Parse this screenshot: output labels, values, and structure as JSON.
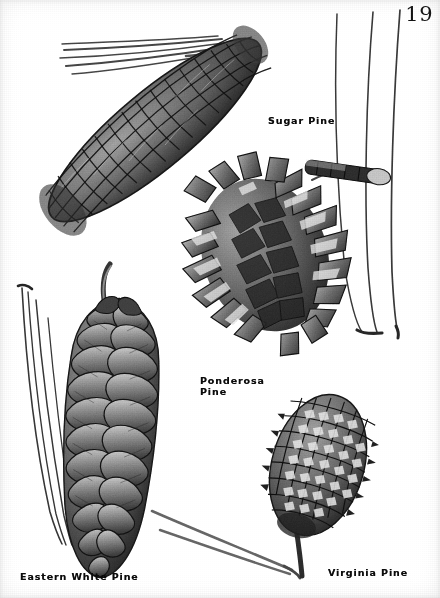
{
  "plate": {
    "page_number": "19",
    "background_color": "#fdfdfb",
    "ink_color": "#1a1a1a",
    "medium": "halftone photographic plate",
    "subject": "pine cones"
  },
  "specimens": [
    {
      "id": "sugar-pine",
      "label": "Sugar Pine",
      "label_lines": "Sugar Pine",
      "label_x": 268,
      "label_y": 115,
      "description": "very long tapering cone angled from lower-left to upper-right with broad diamond scales",
      "has_needles": true
    },
    {
      "id": "ponderosa-pine",
      "label": "Ponderosa Pine",
      "label_lines": "Ponderosa\nPine",
      "label_x": 200,
      "label_y": 375,
      "description": "egg-shaped cone with sharply out-turned spiny scale tips, attached to a twig at upper right",
      "has_needles": true
    },
    {
      "id": "eastern-white-pine",
      "label": "Eastern White Pine",
      "label_lines": "Eastern White Pine",
      "label_x": 20,
      "label_y": 571,
      "description": "long slender pendent cone with smooth overlapping rounded scales and a curved stalk at top",
      "has_needles": true
    },
    {
      "id": "virginia-pine",
      "label": "Virginia Pine",
      "label_lines": "Virginia Pine",
      "label_x": 328,
      "label_y": 567,
      "description": "small oval cone with a regular diamond grid of prickled scales",
      "has_needles": true
    }
  ],
  "needle_groups": [
    {
      "id": "sugar-pine-needles",
      "count": 5,
      "location": "upper-left, fanning from the cone tip"
    },
    {
      "id": "ponderosa-pine-needles",
      "count": 3,
      "location": "right edge, long curving needles bundled at bottom"
    },
    {
      "id": "eastern-white-pine-needles",
      "count": 4,
      "location": "left edge, long arching needles"
    },
    {
      "id": "virginia-pine-needles",
      "count": 2,
      "location": "bottom center, converging at the cone base"
    }
  ]
}
